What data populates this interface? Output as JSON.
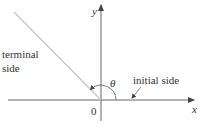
{
  "diagram": {
    "axes": {
      "x_label": "x",
      "y_label": "y",
      "origin_label": "0"
    },
    "angle": {
      "symbol": "θ",
      "direction": "counterclockwise",
      "degrees_approx": 135
    },
    "labels": {
      "terminal_line1": "terminal",
      "terminal_line2": "side",
      "initial": "initial side"
    },
    "colors": {
      "axis": "#555555",
      "terminal_side": "#c8c8c8",
      "text": "#333333",
      "background": "#ffffff"
    }
  }
}
